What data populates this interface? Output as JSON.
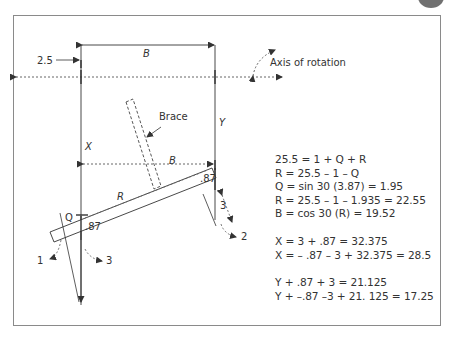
{
  "diagram": {
    "labels": {
      "top_dim": "B",
      "offset": "2.5",
      "axis": "Axis of rotation",
      "brace": "Brace",
      "x": "X",
      "y": "Y",
      "mid_dim": "B",
      "r": "R",
      "q": "Q",
      "left_87": ".87",
      "right_87": ".87",
      "right_3": "3",
      "arrow_1": "1",
      "arrow_2": "2",
      "arrow_3": "3"
    },
    "colors": {
      "line": "#333333",
      "frame": "#8a8a8a",
      "badge": "#707070"
    }
  },
  "equations": {
    "group1": [
      "25.5 = 1 + Q + R",
      "R = 25.5 – 1 – Q",
      "Q = sin 30 (3.87) = 1.95",
      "R = 25.5 – 1 – 1.935 = 22.55",
      "B = cos 30 (R) = 19.52"
    ],
    "group2": [
      "X = 3 + .87 = 32.375",
      "X = – .87 – 3 + 32.375 = 28.5"
    ],
    "group3": [
      "Y + .87 + 3 = 21.125",
      "Y + –.87 –3 + 21. 125 = 17.25"
    ]
  }
}
